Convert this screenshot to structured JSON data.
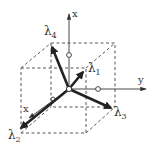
{
  "diagram": {
    "colors": {
      "ink": "#333333",
      "background": "#ffffff"
    },
    "axes": {
      "vertical": {
        "label": "x"
      },
      "horizontal": {
        "label": "y"
      },
      "diagonal": {
        "label": "x"
      }
    },
    "vectors": [
      {
        "id": "lambda1",
        "symbol": "λ",
        "subscript": "1"
      },
      {
        "id": "lambda2",
        "symbol": "λ",
        "subscript": "2"
      },
      {
        "id": "lambda3",
        "symbol": "λ",
        "subscript": "3"
      },
      {
        "id": "lambda4",
        "symbol": "λ",
        "subscript": "4"
      }
    ]
  }
}
